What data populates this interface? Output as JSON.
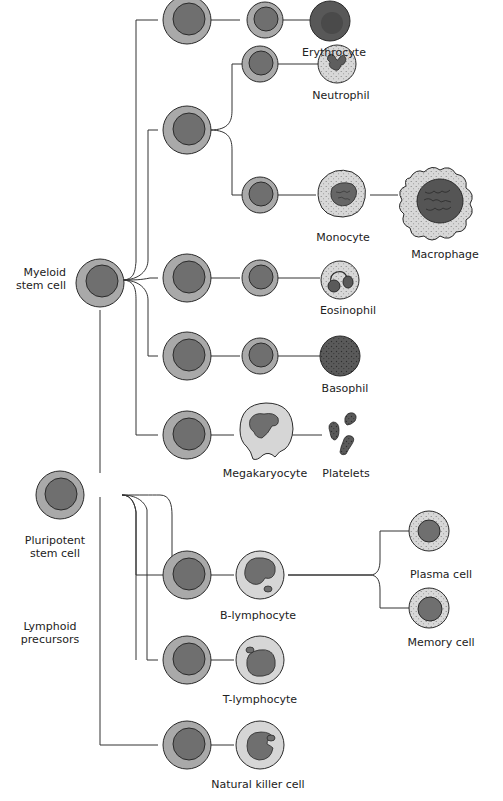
{
  "colors": {
    "outer": "#a9a9a9",
    "nucleus": "#6f6f6f",
    "stroke": "#2b2b2b",
    "light": "#d6d6d6",
    "dark_cell": "#585858",
    "line": "#333333"
  },
  "labels": {
    "myeloid": [
      "Myeloid",
      "stem cell"
    ],
    "pluripotent": [
      "Pluripotent",
      "stem cell"
    ],
    "lymphoid": [
      "Lymphoid",
      "precursors"
    ],
    "erythrocyte": "Erythrocyte",
    "neutrophil": "Neutrophil",
    "monocyte": "Monocyte",
    "macrophage": "Macrophage",
    "eosinophil": "Eosinophil",
    "basophil": "Basophil",
    "megakaryocyte": "Megakaryocyte",
    "platelets": "Platelets",
    "b_lymphocyte": "B-lymphocyte",
    "plasma_cell": "Plasma cell",
    "memory_cell": "Memory cell",
    "t_lymphocyte": "T-lymphocyte",
    "nk_cell": "Natural killer cell"
  }
}
